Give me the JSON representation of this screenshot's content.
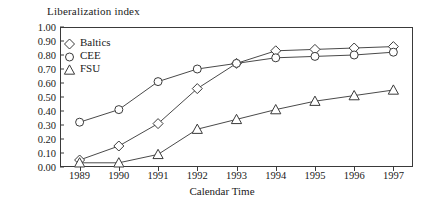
{
  "chart_data": {
    "type": "line",
    "title": "Liberalization index",
    "xlabel": "Calendar Time",
    "ylabel": "",
    "x": [
      1989,
      1990,
      1991,
      1992,
      1993,
      1994,
      1995,
      1996,
      1997
    ],
    "xticklabels": [
      "1989",
      "1990",
      "1991",
      "1992",
      "1993",
      "1994",
      "1995",
      "1996",
      "1997"
    ],
    "yticklabels": [
      "0.00",
      "0.10",
      "0.20",
      "0.30",
      "0.40",
      "0.50",
      "0.60",
      "0.70",
      "0.80",
      "0.90",
      "1.00"
    ],
    "yticks": [
      0.0,
      0.1,
      0.2,
      0.3,
      0.4,
      0.5,
      0.6,
      0.7,
      0.8,
      0.9,
      1.0
    ],
    "ylim": [
      0.0,
      1.0
    ],
    "xlim": [
      1989,
      1997
    ],
    "grid": false,
    "legend_position": "top-left",
    "series": [
      {
        "name": "Baltics",
        "marker": "diamond",
        "values": [
          0.05,
          0.15,
          0.31,
          0.56,
          0.74,
          0.83,
          0.84,
          0.85,
          0.86
        ]
      },
      {
        "name": "CEE",
        "marker": "circle",
        "values": [
          0.32,
          0.41,
          0.61,
          0.7,
          0.74,
          0.78,
          0.79,
          0.8,
          0.82
        ]
      },
      {
        "name": "FSU",
        "marker": "triangle",
        "values": [
          0.03,
          0.03,
          0.09,
          0.27,
          0.34,
          0.41,
          0.47,
          0.51,
          0.55
        ]
      }
    ]
  },
  "colors": {
    "axis": "#3a3a3a",
    "line": "#4a4a4a",
    "marker_fill": "#ffffff",
    "background": "#ffffff"
  }
}
